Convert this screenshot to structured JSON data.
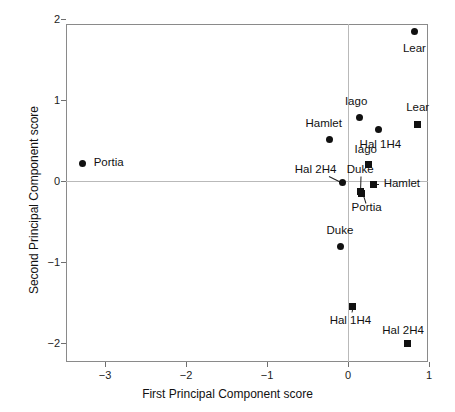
{
  "figure": {
    "kind": "scatter-plot",
    "background": "#ffffff",
    "frame_color": "#8a8a8a",
    "marker_color": "#111111"
  },
  "chart_data": {
    "type": "scatter",
    "title": "",
    "xlabel": "First Principal Component score",
    "ylabel": "Second Principal Component score",
    "xlim": [
      -3.48,
      1.0
    ],
    "ylim": [
      -2.25,
      2.0
    ],
    "xticks": [
      -3,
      -2,
      -1,
      0,
      1
    ],
    "xticklabels": [
      "−3",
      "−2",
      "−1",
      "0",
      "1"
    ],
    "yticks": [
      -2,
      -1,
      0,
      1,
      2
    ],
    "yticklabels": [
      "−2",
      "−1",
      "0",
      "1",
      "2"
    ],
    "grid": false,
    "zero_lines": true,
    "legend": "none",
    "series": [
      {
        "name": "circles",
        "marker": "circle",
        "points": [
          {
            "label": "Lear",
            "x": 0.82,
            "y": 1.85
          },
          {
            "label": "Iago",
            "x": 0.14,
            "y": 0.78
          },
          {
            "label": "Hal 1H4",
            "x": 0.38,
            "y": 0.63
          },
          {
            "label": "Hamlet",
            "x": -0.23,
            "y": 0.51
          },
          {
            "label": "Portia",
            "x": -3.28,
            "y": 0.22
          },
          {
            "label": "Hal 2H4",
            "x": -0.07,
            "y": -0.02
          },
          {
            "label": "Duke",
            "x": -0.09,
            "y": -0.81
          }
        ]
      },
      {
        "name": "squares",
        "marker": "square",
        "points": [
          {
            "label": "Lear",
            "x": 0.86,
            "y": 0.7
          },
          {
            "label": "Iago",
            "x": 0.25,
            "y": 0.2
          },
          {
            "label": "Hamlet",
            "x": 0.31,
            "y": -0.04
          },
          {
            "label": "Duke",
            "x": 0.16,
            "y": -0.13
          },
          {
            "label": "Portia",
            "x": 0.17,
            "y": -0.15
          },
          {
            "label": "Hal 1H4",
            "x": 0.06,
            "y": -1.55
          },
          {
            "label": "Hal 2H4",
            "x": 0.73,
            "y": -2.0
          }
        ]
      }
    ],
    "annotations": [
      {
        "text": "Lear",
        "x": 0.82,
        "y": 1.63,
        "align": "center",
        "for": "circle Lear"
      },
      {
        "text": "Iago",
        "x": 0.1,
        "y": 0.97,
        "align": "center",
        "for": "circle Iago"
      },
      {
        "text": "Lear",
        "x": 0.86,
        "y": 0.9,
        "align": "center",
        "for": "square Lear"
      },
      {
        "text": "Hamlet",
        "x": -0.3,
        "y": 0.7,
        "align": "center",
        "for": "circle Hamlet"
      },
      {
        "text": "Hal 1H4",
        "x": 0.4,
        "y": 0.44,
        "align": "center",
        "for": "circle Hal 1H4"
      },
      {
        "text": "Iago",
        "x": 0.22,
        "y": 0.38,
        "align": "center",
        "for": "square Iago"
      },
      {
        "text": "Portia",
        "x": -3.14,
        "y": 0.22,
        "align": "left",
        "for": "circle Portia"
      },
      {
        "text": "Hal 2H4",
        "x": -0.4,
        "y": 0.14,
        "align": "center",
        "for": "circle Hal 2H4"
      },
      {
        "text": "Duke",
        "x": 0.15,
        "y": 0.14,
        "align": "center",
        "for": "square Duke"
      },
      {
        "text": "Hamlet",
        "x": 0.44,
        "y": -0.04,
        "align": "left",
        "for": "square Hamlet"
      },
      {
        "text": "Portia",
        "x": 0.23,
        "y": -0.33,
        "align": "center",
        "for": "square Portia"
      },
      {
        "text": "Duke",
        "x": -0.1,
        "y": -0.62,
        "align": "center",
        "for": "circle Duke"
      },
      {
        "text": "Hal 1H4",
        "x": 0.03,
        "y": -1.73,
        "align": "center",
        "for": "square Hal 1H4"
      },
      {
        "text": "Hal 2H4",
        "x": 0.68,
        "y": -1.85,
        "align": "center",
        "for": "square Hal 2H4"
      }
    ],
    "leaders": [
      {
        "from": {
          "x": -0.23,
          "y": 0.06
        },
        "to": {
          "x": -0.09,
          "y": -0.01
        }
      },
      {
        "from": {
          "x": 0.16,
          "y": 0.06
        },
        "to": {
          "x": 0.155,
          "y": -0.1
        }
      },
      {
        "from": {
          "x": 0.38,
          "y": -0.04
        },
        "to": {
          "x": 0.325,
          "y": -0.04
        }
      },
      {
        "from": {
          "x": 0.22,
          "y": -0.27
        },
        "to": {
          "x": 0.185,
          "y": -0.16
        }
      },
      {
        "from": {
          "x": 0.05,
          "y": -1.62
        },
        "to": {
          "x": 0.062,
          "y": -1.56
        }
      }
    ]
  }
}
